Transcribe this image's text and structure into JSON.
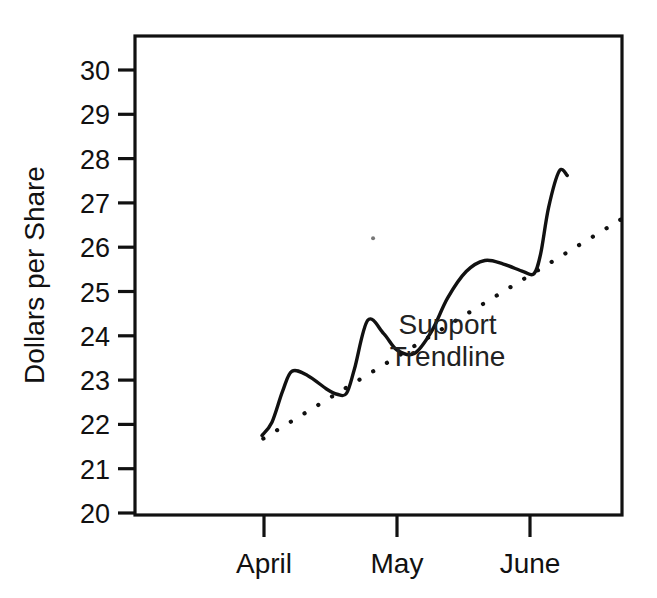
{
  "chart_data": {
    "type": "line",
    "title": "",
    "xlabel": "",
    "ylabel": "Dollars per Share",
    "ylim": [
      20,
      30.5
    ],
    "yticks": [
      20,
      21,
      22,
      23,
      24,
      25,
      26,
      27,
      28,
      29,
      30
    ],
    "ytick_labels": [
      "20",
      "21",
      "22",
      "23",
      "24",
      "25",
      "26",
      "27",
      "28",
      "29",
      "30"
    ],
    "categories": [
      "April",
      "May",
      "June"
    ],
    "category_positions": [
      0.0,
      1.0,
      2.0
    ],
    "xlim": [
      -0.82,
      2.72
    ],
    "grid": false,
    "legend": "none",
    "annotations": [
      {
        "name": "support-trendline-label",
        "lines": [
          "Support",
          "Trendline"
        ],
        "x_month": 1.38,
        "y_value": 24.05
      }
    ],
    "series": [
      {
        "name": "Price",
        "style": "solid",
        "color": "#111111",
        "x_month": [
          -0.015,
          0.06,
          0.14,
          0.21,
          0.33,
          0.47,
          0.55,
          0.62,
          0.68,
          0.78,
          0.9,
          1.0,
          1.13,
          1.26,
          1.38,
          1.52,
          1.66,
          1.8,
          1.95,
          2.03,
          2.08,
          2.14,
          2.22,
          2.28
        ],
        "y_value": [
          21.75,
          22.05,
          22.75,
          23.2,
          23.1,
          22.8,
          22.68,
          22.7,
          23.25,
          24.35,
          24.05,
          23.68,
          23.6,
          24.1,
          24.85,
          25.45,
          25.7,
          25.62,
          25.45,
          25.4,
          25.85,
          26.9,
          27.72,
          27.62
        ]
      },
      {
        "name": "Support Trendline",
        "style": "dotted",
        "color": "#111111",
        "x_month": [
          -0.005,
          2.68
        ],
        "y_value": [
          21.68,
          26.62
        ]
      }
    ],
    "stray_marks": [
      {
        "name": "stray-speck",
        "x_month": 0.82,
        "y_value": 26.2
      }
    ]
  },
  "axes": {
    "y_axis_title": "Dollars per Share",
    "y_tick_labels": [
      "30",
      "29",
      "28",
      "27",
      "26",
      "25",
      "24",
      "23",
      "22",
      "21",
      "20"
    ],
    "x_tick_labels": [
      "April",
      "May",
      "June"
    ]
  },
  "annotation_text": {
    "line1": "Support",
    "line2": "Trendline"
  }
}
